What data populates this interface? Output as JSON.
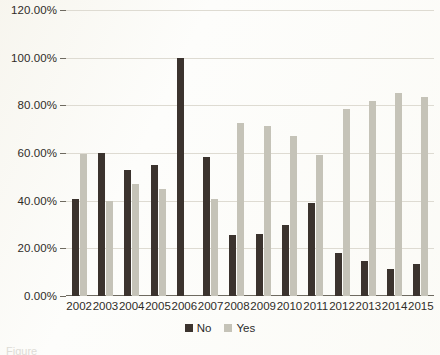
{
  "chart_data": {
    "type": "bar",
    "title": "",
    "xlabel": "",
    "ylabel": "",
    "ylim": [
      0,
      120
    ],
    "ytick_labels": [
      "0.00%",
      "20.00%",
      "40.00%",
      "60.00%",
      "80.00%",
      "100.00%",
      "120.00%"
    ],
    "yticks": [
      0,
      20,
      40,
      60,
      80,
      100,
      120
    ],
    "grid": true,
    "legend_position": "bottom-center",
    "categories": [
      "2002",
      "2003",
      "2004",
      "2005",
      "2006",
      "2007",
      "2008",
      "2009",
      "2010",
      "2011",
      "2012",
      "2013",
      "2014",
      "2015"
    ],
    "series": [
      {
        "name": "No",
        "color": "#3b332e",
        "values": [
          40.5,
          60.0,
          53.0,
          55.0,
          100.0,
          58.5,
          25.5,
          26.0,
          30.0,
          39.0,
          18.0,
          14.5,
          11.5,
          13.5
        ]
      },
      {
        "name": "Yes",
        "color": "#c5c3b8",
        "values": [
          59.5,
          40.0,
          47.0,
          45.0,
          0.0,
          40.5,
          72.5,
          71.5,
          67.0,
          59.0,
          78.5,
          82.0,
          85.0,
          83.5
        ]
      }
    ]
  },
  "legend": {
    "items": [
      {
        "label": "No",
        "color": "#3b332e"
      },
      {
        "label": "Yes",
        "color": "#c5c3b8"
      }
    ]
  },
  "caption": {
    "text": "Figure"
  },
  "colors": {
    "background": "#fdfdfb",
    "gridline": "#dedbd2",
    "axis": "#6e6a60",
    "text": "#2f2c28"
  }
}
